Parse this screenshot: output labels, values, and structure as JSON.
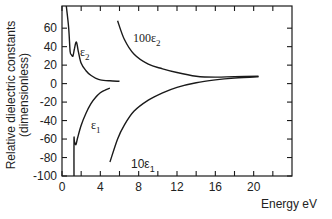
{
  "chart_data": {
    "type": "line",
    "title": "",
    "xlabel": "Energy eV",
    "ylabel": "Relative dielectric constants",
    "ylabel_sub": "(dimensionless)",
    "xlim": [
      0,
      24
    ],
    "ylim": [
      -100,
      84
    ],
    "x_ticks": [
      0,
      4,
      8,
      12,
      16,
      20
    ],
    "x_tick_labels": [
      "0",
      "4",
      "8",
      "12",
      "16",
      "20"
    ],
    "x_minor_ticks": [
      2,
      6,
      10,
      14,
      18,
      22
    ],
    "y_ticks": [
      60,
      40,
      20,
      0,
      -20,
      -40,
      -60,
      -80,
      -100
    ],
    "y_tick_labels": [
      "60",
      "40",
      "20",
      "0",
      "-20",
      "-40",
      "-60",
      "-80",
      "-100"
    ],
    "grid": false,
    "legend": "inline curve labels",
    "series": [
      {
        "name": "ε2",
        "label_main": "ε",
        "label_sub": "2",
        "x": [
          0.45,
          0.7,
          0.85,
          1.0,
          1.15,
          1.3,
          1.5,
          1.7,
          2.0,
          2.5,
          3.0,
          3.5,
          4.0,
          5.0,
          6.0
        ],
        "y": [
          84,
          60,
          35,
          31,
          30,
          38,
          45,
          35,
          22,
          14,
          9,
          6,
          4,
          3,
          2.5
        ]
      },
      {
        "name": "ε1",
        "label_main": "ε",
        "label_sub": "1",
        "x": [
          1.25,
          1.25,
          1.3,
          1.45,
          1.6,
          2.0,
          2.5,
          3.0,
          3.5,
          4.0,
          4.5,
          5.0
        ],
        "y": [
          -100,
          -60,
          -63,
          -66,
          -60,
          -45,
          -32,
          -22,
          -15,
          -10,
          -7,
          -5
        ]
      },
      {
        "name": "100ε2",
        "label_main": "100ε",
        "label_sub": "2",
        "x": [
          5.8,
          6.5,
          7.5,
          9.0,
          10.5,
          12.0,
          14.0,
          16.0,
          18.0,
          20.5
        ],
        "y": [
          68,
          48,
          32,
          21,
          16,
          12,
          8,
          7,
          7.5,
          8
        ]
      },
      {
        "name": "10ε1",
        "label_main": "10ε",
        "label_sub": "1",
        "x": [
          5.0,
          5.8,
          6.5,
          7.5,
          9.0,
          10.5,
          12.0,
          14.0,
          16.0,
          18.0,
          20.5
        ],
        "y": [
          -85,
          -60,
          -45,
          -30,
          -18,
          -10,
          -4,
          1,
          4,
          6,
          7.5
        ]
      }
    ]
  },
  "labels": {
    "xlabel": "Energy eV",
    "ylabel_line1": "Relative dielectric constants",
    "ylabel_line2": "(dimensionless)",
    "eps2_main": "ε",
    "eps2_sub": "2",
    "eps1_main": "ε",
    "eps1_sub": "1",
    "e100eps2_main": "100ε",
    "e100eps2_sub": "2",
    "e10eps1_main": "10ε",
    "e10eps1_sub": "1"
  }
}
